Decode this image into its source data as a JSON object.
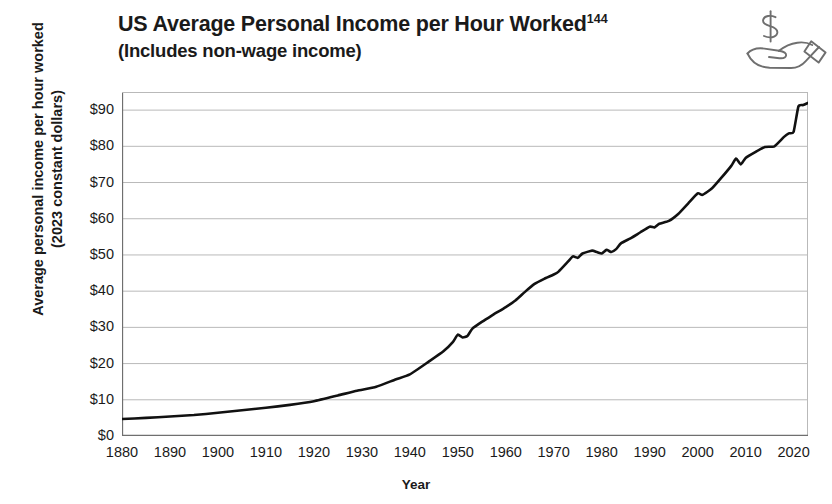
{
  "chart_data": {
    "type": "line",
    "title": "US Average Personal Income per Hour Worked",
    "title_footnote": "144",
    "subtitle": "(Includes non-wage income)",
    "xlabel": "Year",
    "ylabel": "Average personal income per hour worked\n(2023 constant dollars)",
    "ylabel_line1": "Average personal income per hour worked",
    "ylabel_line2": "(2023 constant dollars)",
    "xlim": [
      1880,
      2023
    ],
    "ylim": [
      0,
      95
    ],
    "y_ticks": [
      0,
      10,
      20,
      30,
      40,
      50,
      60,
      70,
      80,
      90
    ],
    "y_tick_labels": [
      "$0",
      "$10",
      "$20",
      "$30",
      "$40",
      "$50",
      "$60",
      "$70",
      "$80",
      "$90"
    ],
    "x_ticks": [
      1880,
      1890,
      1900,
      1910,
      1920,
      1930,
      1940,
      1950,
      1960,
      1970,
      1980,
      1990,
      2000,
      2010,
      2020
    ],
    "x_tick_labels": [
      "1880",
      "1890",
      "1900",
      "1910",
      "1920",
      "1930",
      "1940",
      "1950",
      "1960",
      "1970",
      "1980",
      "1990",
      "2000",
      "2010",
      "2020"
    ],
    "x_minor_tick_interval": 2,
    "grid": "horizontal",
    "legend": "none",
    "line_color": "#111111",
    "grid_color": "#b9b9b9",
    "axis_color": "#8a8a8a",
    "series": [
      {
        "name": "US average personal income per hour worked (2023 constant dollars)",
        "x": [
          1880,
          1885,
          1890,
          1895,
          1900,
          1905,
          1910,
          1915,
          1920,
          1925,
          1929,
          1933,
          1937,
          1940,
          1944,
          1947,
          1949,
          1950,
          1951,
          1952,
          1953,
          1955,
          1957,
          1960,
          1962,
          1964,
          1966,
          1968,
          1970,
          1971,
          1973,
          1974,
          1975,
          1976,
          1978,
          1979,
          1980,
          1981,
          1982,
          1983,
          1984,
          1986,
          1988,
          1990,
          1991,
          1992,
          1994,
          1996,
          1998,
          2000,
          2001,
          2003,
          2005,
          2007,
          2008,
          2009,
          2010,
          2012,
          2014,
          2016,
          2018,
          2019,
          2020,
          2021,
          2022,
          2023
        ],
        "y": [
          4.7,
          5.0,
          5.4,
          5.8,
          6.4,
          7.1,
          7.8,
          8.6,
          9.6,
          11.2,
          12.5,
          13.6,
          15.6,
          17.0,
          20.6,
          23.4,
          26.0,
          28.0,
          27.2,
          27.6,
          29.6,
          31.5,
          33.2,
          35.6,
          37.4,
          39.8,
          42.0,
          43.4,
          44.6,
          45.4,
          48.2,
          49.6,
          49.2,
          50.4,
          51.2,
          50.8,
          50.4,
          51.4,
          50.8,
          51.6,
          53.2,
          54.6,
          56.2,
          57.8,
          57.6,
          58.6,
          59.4,
          61.4,
          64.2,
          67.0,
          66.6,
          68.4,
          71.4,
          74.6,
          76.6,
          75.0,
          76.8,
          78.4,
          79.8,
          80.0,
          82.6,
          83.6,
          84.0,
          91.0,
          91.4,
          92.0
        ]
      }
    ],
    "annotations": [
      {
        "label": "post-WWII dip",
        "x": 1951,
        "y": 27.2
      },
      {
        "label": "1970s-80s plateau",
        "x": 1980,
        "y": 50.6
      },
      {
        "label": "Great Recession dip",
        "x": 2009,
        "y": 75.0
      },
      {
        "label": "2020-21 stimulus spike",
        "x": 2021,
        "y": 91.0
      }
    ]
  },
  "icons": {
    "hand_dollar": "hand-holding-dollar-icon"
  }
}
